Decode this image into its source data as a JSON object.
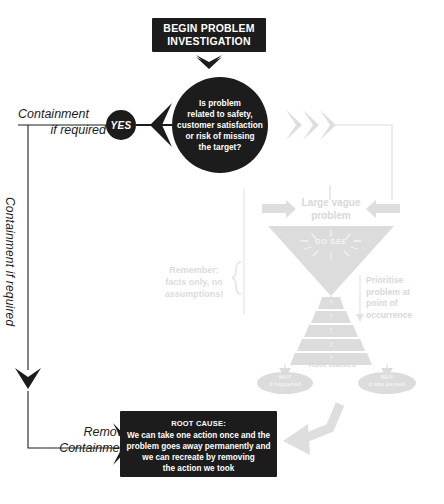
{
  "diagram": {
    "colors": {
      "ink": "#1c1c1c",
      "ghost": "#d8d8d8",
      "ghost_fill": "#e2e2e2",
      "white": "#ffffff"
    }
  },
  "begin": {
    "line1": "BEGIN PROBLEM",
    "line2": "INVESTIGATION"
  },
  "decision": {
    "line1": "Is problem",
    "line2": "related to safety,",
    "line3": "customer satisfaction",
    "line4": "or risk of missing",
    "line5": "the target?",
    "yes_label": "YES"
  },
  "containment": {
    "top_line1": "Containment",
    "top_line2": "if required",
    "vertical_label": "Containment if required",
    "remove_line1": "Remove",
    "remove_line2": "Containment"
  },
  "root_cause": {
    "title": "ROOT CAUSE:",
    "line1": "We can take one action once and the",
    "line2": "problem goes away permanently and",
    "line3": "we can recreate by removing",
    "line4": "the action we took"
  },
  "investigation_cluster": {
    "large_vague_line1": "Large vague",
    "large_vague_line2": "problem",
    "go_see": "GO SEE",
    "prioritise_line1": "Prioritise",
    "prioritise_line2": "problem at",
    "prioritise_line3": "point of",
    "prioritise_line4": "occurrence",
    "remember_line1": "Remember:",
    "remember_line2": "facts only, no",
    "remember_line3": "assumptions!",
    "root_causes_label": "Root causes",
    "pyramid_levels": [
      "?",
      "?",
      "?",
      "?",
      "?"
    ],
    "why_left_line1": "WHY",
    "why_left_line2": "it happened",
    "why_right_line1": "WHY",
    "why_right_line2": "it was passed"
  }
}
